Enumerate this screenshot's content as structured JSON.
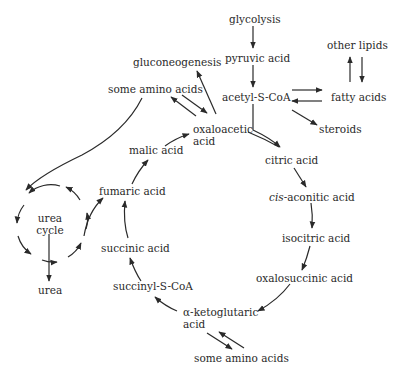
{
  "diagram": {
    "nodes": {
      "glycolysis": "glycolysis",
      "pyruvic_acid": "pyruvic acid",
      "acetyl_s_coa": "acetyl-S-CoA",
      "other_lipids": "other lipids",
      "fatty_acids": "fatty acids",
      "steroids": "steroids",
      "gluconeogenesis": "gluconeogenesis",
      "some_amino_acids_top": "some amino acids",
      "oxaloacetic_acid_1": "oxaloacetic",
      "oxaloacetic_acid_2": "acid",
      "citric_acid": "citric acid",
      "cis_prefix": "cis",
      "aconitic_acid": "-aconitic acid",
      "isocitric_acid": "isocitric acid",
      "oxalosuccinic_acid": "oxalosuccinic acid",
      "alpha_ketoglutaric_1": "α-ketoglutaric",
      "alpha_ketoglutaric_2": "acid",
      "some_amino_acids_bottom": "some amino acids",
      "succinyl_s_coa": "succinyl-S-CoA",
      "succinic_acid": "succinic acid",
      "fumaric_acid": "fumaric acid",
      "malic_acid": "malic acid",
      "urea_cycle_1": "urea",
      "urea_cycle_2": "cycle",
      "urea": "urea"
    },
    "edges": [
      {
        "from": "glycolysis",
        "to": "pyruvic acid"
      },
      {
        "from": "pyruvic acid",
        "to": "acetyl-S-CoA"
      },
      {
        "from": "acetyl-S-CoA",
        "to": "fatty acids"
      },
      {
        "from": "fatty acids",
        "to": "acetyl-S-CoA"
      },
      {
        "from": "fatty acids",
        "to": "other lipids"
      },
      {
        "from": "other lipids",
        "to": "fatty acids"
      },
      {
        "from": "acetyl-S-CoA",
        "to": "steroids"
      },
      {
        "from": "acetyl-S-CoA",
        "to": "citric acid"
      },
      {
        "from": "oxaloacetic acid",
        "to": "citric acid"
      },
      {
        "from": "oxaloacetic acid",
        "to": "gluconeogenesis"
      },
      {
        "from": "oxaloacetic acid",
        "to": "some amino acids"
      },
      {
        "from": "some amino acids",
        "to": "oxaloacetic acid"
      },
      {
        "from": "citric acid",
        "to": "cis-aconitic acid"
      },
      {
        "from": "cis-aconitic acid",
        "to": "isocitric acid"
      },
      {
        "from": "isocitric acid",
        "to": "oxalosuccinic acid"
      },
      {
        "from": "oxalosuccinic acid",
        "to": "α-ketoglutaric acid"
      },
      {
        "from": "α-ketoglutaric acid",
        "to": "some amino acids"
      },
      {
        "from": "some amino acids",
        "to": "α-ketoglutaric acid"
      },
      {
        "from": "α-ketoglutaric acid",
        "to": "succinyl-S-CoA"
      },
      {
        "from": "succinyl-S-CoA",
        "to": "succinic acid"
      },
      {
        "from": "succinic acid",
        "to": "fumaric acid"
      },
      {
        "from": "fumaric acid",
        "to": "malic acid"
      },
      {
        "from": "malic acid",
        "to": "oxaloacetic acid"
      },
      {
        "from": "some amino acids",
        "to": "urea cycle"
      },
      {
        "from": "urea cycle",
        "to": "fumaric acid"
      },
      {
        "from": "urea cycle",
        "to": "urea"
      }
    ]
  }
}
